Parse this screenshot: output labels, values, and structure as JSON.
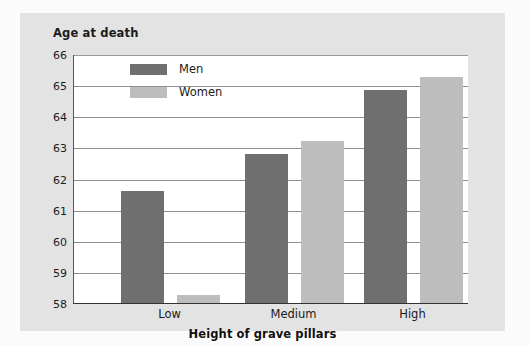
{
  "figure": {
    "background_color": "#e3e3e3",
    "page_color": "#fbfbfb"
  },
  "chart_data": {
    "type": "bar",
    "title": "Age at death",
    "subtitle": "",
    "xlabel": "Height of grave pillars",
    "ylabel": "Age at death",
    "categories": [
      "Low",
      "Medium",
      "High"
    ],
    "series": [
      {
        "name": "Men",
        "color": "#6f6f6f",
        "values": [
          61.6,
          62.8,
          64.85
        ]
      },
      {
        "name": "Women",
        "color": "#bdbdbd",
        "values": [
          58.25,
          63.2,
          65.25
        ]
      }
    ],
    "ylim": [
      58,
      66
    ],
    "yticks": [
      58,
      59,
      60,
      61,
      62,
      63,
      64,
      65,
      66
    ],
    "ytick_labels": [
      "58",
      "59",
      "60",
      "61",
      "62",
      "63",
      "64",
      "65",
      "66"
    ],
    "grid": true,
    "grid_axis": "y",
    "legend_position": "upper left inside"
  },
  "legend": {
    "items": [
      {
        "label": "Men",
        "swatch": "men-swatch"
      },
      {
        "label": "Women",
        "swatch": "women-swatch"
      }
    ]
  },
  "axis": {
    "x_title": "Height of grave pillars",
    "y_title": "Age at death"
  }
}
